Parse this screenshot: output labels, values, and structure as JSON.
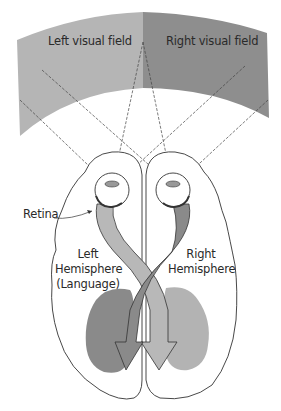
{
  "figure": {
    "labels": {
      "left_visual_field": "Left visual field",
      "right_visual_field": "Right visual field",
      "retina": "Retina",
      "left_hemisphere_line1": "Left",
      "left_hemisphere_line2": "Hemisphere",
      "left_hemisphere_line3": "(Language)",
      "right_hemisphere_line1": "Right",
      "right_hemisphere_line2": "Hemisphere"
    },
    "colors": {
      "left_field": "#b5b5b5",
      "right_field": "#8e8e8e",
      "left_cortex": "#8a8a8a",
      "right_cortex": "#b3b3b3",
      "tract_dark": "#8a8a8a",
      "tract_light": "#b8b8b8",
      "outline": "#333333"
    }
  }
}
